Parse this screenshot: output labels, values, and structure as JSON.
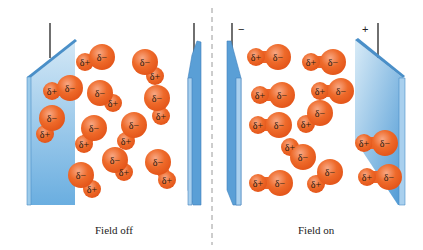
{
  "colors": {
    "molecule_fill": "#ee6a2a",
    "molecule_highlight": "#f8a07a",
    "molecule_edge": "#e05a1c",
    "plate_face": "#b5d6ee",
    "plate_face_dark": "#5a9fd6",
    "plate_edge": "#4a8fc8",
    "wire": "#222222",
    "divider": "#999999"
  },
  "panels": [
    {
      "caption": "Field off",
      "left_plate_sign": "",
      "right_plate_sign": "",
      "molecules": [
        {
          "neg": [
            102,
            57
          ],
          "pos": [
            85,
            62
          ]
        },
        {
          "neg": [
            145,
            62
          ],
          "pos": [
            155,
            76
          ]
        },
        {
          "neg": [
            70,
            88
          ],
          "pos": [
            52,
            91
          ]
        },
        {
          "neg": [
            100,
            93
          ],
          "pos": [
            113,
            103
          ]
        },
        {
          "neg": [
            157,
            98
          ],
          "pos": [
            161,
            116
          ]
        },
        {
          "neg": [
            52,
            118
          ],
          "pos": [
            45,
            134
          ]
        },
        {
          "neg": [
            94,
            128
          ],
          "pos": [
            84,
            144
          ]
        },
        {
          "neg": [
            134,
            125
          ],
          "pos": [
            126,
            141
          ]
        },
        {
          "neg": [
            115,
            160
          ],
          "pos": [
            124,
            172
          ]
        },
        {
          "neg": [
            158,
            162
          ],
          "pos": [
            167,
            180
          ]
        },
        {
          "neg": [
            81,
            175
          ],
          "pos": [
            92,
            189
          ]
        }
      ]
    },
    {
      "caption": "Field on",
      "left_plate_sign": "−",
      "right_plate_sign": "+",
      "molecules": [
        {
          "neg": [
            278,
            57
          ],
          "pos": [
            256,
            57
          ]
        },
        {
          "neg": [
            333,
            62
          ],
          "pos": [
            311,
            62
          ]
        },
        {
          "neg": [
            282,
            95
          ],
          "pos": [
            260,
            95
          ]
        },
        {
          "neg": [
            341,
            91
          ],
          "pos": [
            320,
            91
          ]
        },
        {
          "neg": [
            320,
            113
          ],
          "pos": [
            306,
            124
          ]
        },
        {
          "neg": [
            279,
            125
          ],
          "pos": [
            258,
            125
          ]
        },
        {
          "neg": [
            303,
            157
          ],
          "pos": [
            290,
            147
          ]
        },
        {
          "neg": [
            385,
            143
          ],
          "pos": [
            364,
            143
          ]
        },
        {
          "neg": [
            280,
            183
          ],
          "pos": [
            258,
            183
          ]
        },
        {
          "neg": [
            330,
            172
          ],
          "pos": [
            316,
            184
          ]
        },
        {
          "neg": [
            389,
            177
          ],
          "pos": [
            367,
            177
          ]
        }
      ]
    }
  ],
  "labels": {
    "neg": "δ−",
    "pos": "δ+"
  }
}
